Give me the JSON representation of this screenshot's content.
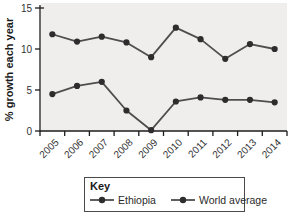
{
  "chart_data": {
    "type": "line",
    "title": "",
    "xlabel": "",
    "ylabel": "% growth each year",
    "categories": [
      "2005",
      "2006",
      "2007",
      "2008",
      "2009",
      "2010",
      "2011",
      "2012",
      "2013",
      "2014"
    ],
    "series": [
      {
        "name": "Ethiopia",
        "values": [
          11.8,
          10.9,
          11.5,
          10.8,
          9.0,
          12.6,
          11.2,
          8.8,
          10.6,
          10.0
        ]
      },
      {
        "name": "World average",
        "values": [
          4.5,
          5.5,
          6.0,
          2.5,
          0.1,
          3.6,
          4.1,
          3.8,
          3.8,
          3.5
        ]
      }
    ],
    "ylim": [
      0,
      15
    ],
    "yticks": [
      0,
      5,
      10,
      15
    ],
    "grid": false,
    "legend": {
      "title": "Key",
      "position": "bottom"
    },
    "colors": {
      "line": "#4f4d4d",
      "marker": "#2e2c2c",
      "plot_background": "#f0eeec",
      "axis": "#1c1c1c",
      "text": "#333333"
    }
  }
}
